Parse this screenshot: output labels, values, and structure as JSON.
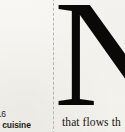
{
  "document": {
    "type": "scanned-page-fragment",
    "background_color": "#f6f5f1",
    "ink_color": "#0a0908"
  },
  "left_column": {
    "caption": {
      "line_1": "s: 16",
      "line_2": "nal cuisine"
    }
  },
  "divider": {
    "style": "dashed",
    "color": "#b9b7b1"
  },
  "right_column": {
    "drop_cap": "N",
    "body_text": "that flows th"
  }
}
